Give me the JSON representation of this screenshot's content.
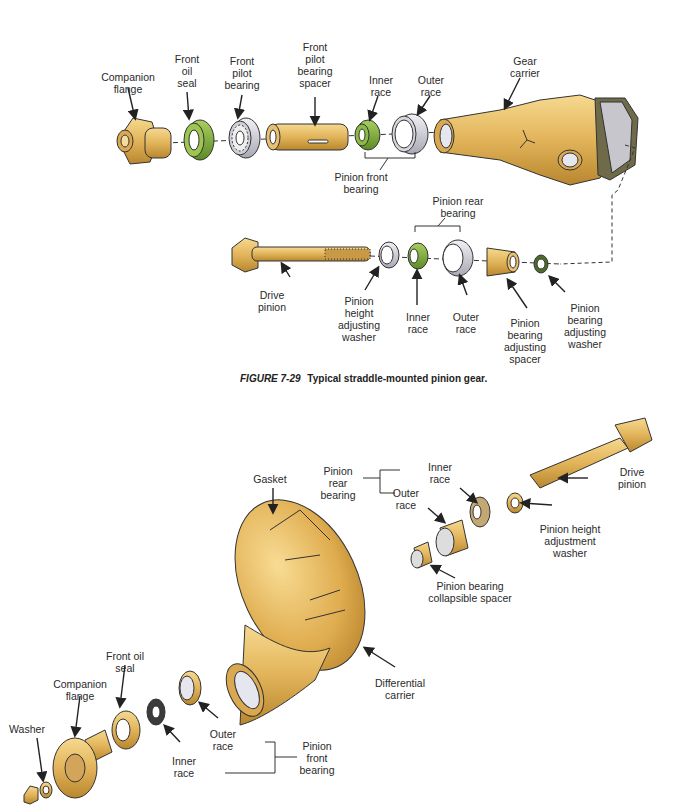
{
  "figure_top": {
    "caption_number": "FIGURE 7-29",
    "caption_text": "Typical straddle-mounted pinion gear.",
    "labels": {
      "companion_flange": "Companion\nflange",
      "front_oil_seal": "Front\noil\nseal",
      "front_pilot_bearing": "Front\npilot\nbearing",
      "front_pilot_bearing_spacer": "Front\npilot\nbearing\nspacer",
      "inner_race": "Inner\nrace",
      "outer_race": "Outer\nrace",
      "gear_carrier": "Gear\ncarrier",
      "pinion_front_bearing": "Pinion front\nbearing",
      "pinion_rear_bearing": "Pinion rear\nbearing",
      "drive_pinion": "Drive\npinion",
      "pinion_height_adjusting_washer": "Pinion\nheight\nadjusting\nwasher",
      "rear_inner_race": "Inner\nrace",
      "rear_outer_race": "Outer\nrace",
      "pinion_bearing_adjusting_spacer": "Pinion\nbearing\nadjusting\nspacer",
      "pinion_bearing_adjusting_washer": "Pinion\nbearing\nadjusting\nwasher"
    }
  },
  "figure_bottom": {
    "labels": {
      "gasket": "Gasket",
      "pinion_rear_bearing": "Pinion\nrear\nbearing",
      "inner_race": "Inner\nrace",
      "outer_race": "Outer\nrace",
      "drive_pinion": "Drive\npinion",
      "pinion_height_adjustment_washer": "Pinion height\nadjustment\nwasher",
      "pinion_bearing_collapsible_spacer": "Pinion bearing\ncollapsible spacer",
      "differential_carrier": "Differential\ncarrier",
      "front_oil_seal": "Front oil\nseal",
      "companion_flange": "Companion\nflange",
      "washer": "Washer",
      "front_outer_race": "Outer\nrace",
      "front_inner_race": "Inner\nrace",
      "pinion_front_bearing": "Pinion\nfront\nbearing"
    }
  },
  "colors": {
    "brass": "#e2b45a",
    "brass_dark": "#b8862e",
    "green": "#7fae3a",
    "silver": "#c9c9d3",
    "outline": "#333333"
  }
}
